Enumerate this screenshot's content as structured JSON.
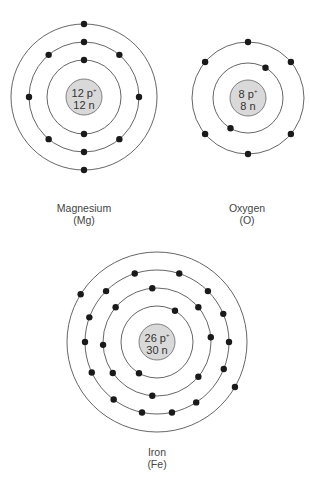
{
  "atoms": [
    {
      "name": "Magnesium",
      "symbol": "(Mg)",
      "protons": "12 p",
      "neutrons": "12 n",
      "center": [
        84,
        97
      ],
      "nucleus_radius": 18,
      "shells": [
        {
          "radius": 37,
          "electrons": [
            90,
            270
          ]
        },
        {
          "radius": 55,
          "electrons": [
            0,
            50,
            90,
            130,
            180,
            230,
            270,
            310
          ]
        },
        {
          "radius": 73,
          "electrons": [
            90,
            270
          ]
        }
      ]
    },
    {
      "name": "Oxygen",
      "symbol": "(O)",
      "protons": "8 p",
      "neutrons": "8 n",
      "center": [
        248,
        98
      ],
      "nucleus_radius": 18,
      "shells": [
        {
          "radius": 35,
          "electrons": [
            60,
            240
          ]
        },
        {
          "radius": 56,
          "electrons": [
            40,
            90,
            140,
            220,
            270,
            320
          ]
        }
      ]
    },
    {
      "name": "Iron",
      "symbol": "(Fe)",
      "protons": "26 p",
      "neutrons": "30 n",
      "center": [
        157,
        342
      ],
      "nucleus_radius": 18,
      "shells": [
        {
          "radius": 36,
          "electrons": [
            60,
            240
          ]
        },
        {
          "radius": 54,
          "electrons": [
            5,
            40,
            95,
            140,
            183,
            215,
            265,
            320
          ]
        },
        {
          "radius": 72,
          "electrons": [
            0,
            23,
            45,
            72,
            108,
            135,
            160,
            180,
            205,
            233,
            258,
            282,
            303,
            338
          ]
        },
        {
          "radius": 90,
          "electrons": [
            148,
            330
          ]
        }
      ]
    }
  ],
  "labels": {
    "magnesium": {
      "name": "Magnesium",
      "symbol": "(Mg)"
    },
    "oxygen": {
      "name": "Oxygen",
      "symbol": "(O)"
    },
    "iron": {
      "name": "Iron",
      "symbol": "(Fe)"
    }
  },
  "nuclei": {
    "magnesium": {
      "protons": "12 p",
      "charge": "+",
      "neutrons": "12 n"
    },
    "oxygen": {
      "protons": "8 p",
      "charge": "+",
      "neutrons": "8 n"
    },
    "iron": {
      "protons": "26 p",
      "charge": "+",
      "neutrons": "30 n"
    }
  },
  "colors": {
    "shell": "#555555",
    "electron": "#1a1a1a",
    "nucleus_fill": "#d9d9d9",
    "nucleus_stroke": "#666666"
  }
}
